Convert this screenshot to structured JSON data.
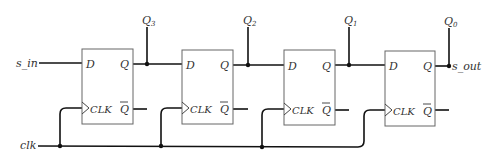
{
  "inputs": {
    "serial_in": "s_in",
    "clock": "clk"
  },
  "output": {
    "serial_out": "s_out"
  },
  "flip_flops": [
    {
      "d": "D",
      "q": "Q",
      "qbar": "Q",
      "clk": "CLK",
      "tap": "Q",
      "tap_sub": "3"
    },
    {
      "d": "D",
      "q": "Q",
      "qbar": "Q",
      "clk": "CLK",
      "tap": "Q",
      "tap_sub": "2"
    },
    {
      "d": "D",
      "q": "Q",
      "qbar": "Q",
      "clk": "CLK",
      "tap": "Q",
      "tap_sub": "1"
    },
    {
      "d": "D",
      "q": "Q",
      "qbar": "Q",
      "clk": "CLK",
      "tap": "Q",
      "tap_sub": "0"
    }
  ],
  "colors": {
    "wire": "#111111",
    "box": "#666666",
    "text": "#333333"
  }
}
